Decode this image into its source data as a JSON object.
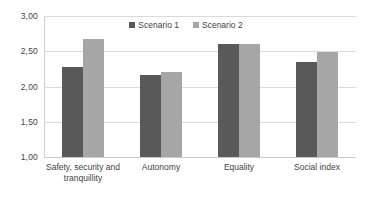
{
  "chart_data": {
    "type": "bar",
    "title": "",
    "subtitle": "",
    "xlabel": "",
    "ylabel": "",
    "ylim": [
      1.0,
      3.0
    ],
    "ytick_labels": [
      "3,00",
      "2,50",
      "2,00",
      "1,50",
      "1,00"
    ],
    "ytick_values": [
      3.0,
      2.5,
      2.0,
      1.5,
      1.0
    ],
    "grid": true,
    "legend_position": "top-center",
    "categories": [
      "Safety, security and\ntranquillity",
      "Autonomy",
      "Equality",
      "Social index"
    ],
    "series": [
      {
        "name": "Scenario 1",
        "color": "#595959",
        "values": [
          2.28,
          2.17,
          2.61,
          2.35
        ]
      },
      {
        "name": "Scenario 2",
        "color": "#a6a6a6",
        "values": [
          2.68,
          2.2,
          2.61,
          2.49
        ]
      }
    ]
  },
  "style": {
    "background": "#ffffff",
    "gridline_color": "#d9d9d9",
    "axis_color": "#d0d0d0",
    "text_color": "#3f3f3f"
  }
}
